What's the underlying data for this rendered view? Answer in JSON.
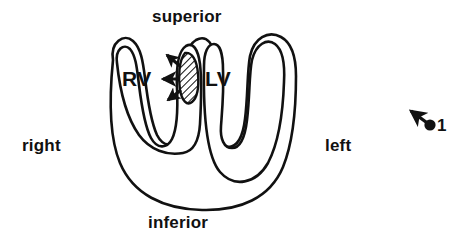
{
  "figure": {
    "kind": "cardiac-short-axis-cross-section",
    "background_color": "#ffffff",
    "ink_color": "#111111"
  },
  "orientation_labels": {
    "superior": "superior",
    "inferior": "inferior",
    "right": "right",
    "left": "left"
  },
  "chamber_labels": {
    "right_ventricle": "RV",
    "left_ventricle": "LV"
  },
  "septum": {
    "name": "interventricular-septum",
    "fill": "diagonal-hatch",
    "hatch_color": "#111111"
  },
  "arrows": [
    {
      "name": "septum-arrow-upper",
      "direction": "up-left"
    },
    {
      "name": "septum-arrow-middle",
      "direction": "left"
    },
    {
      "name": "septum-arrow-lower",
      "direction": "down-left"
    }
  ],
  "orientation_marker": {
    "label": "1",
    "dot": "filled-circle",
    "pointer_direction": "up-left"
  }
}
